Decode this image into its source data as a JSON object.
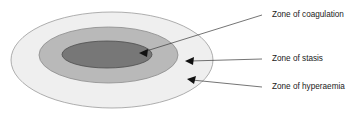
{
  "figure": {
    "background_color": "#ffffff"
  },
  "zones": [
    {
      "id": "coagulation",
      "label": "Zone of coagulation",
      "fill_color": "#777777",
      "stroke_color": "#4d4d4d",
      "ellipse": {
        "cx": 107,
        "cy": 54.5,
        "rx": 45,
        "ry": 13.5
      },
      "label_x": 272,
      "label_y": 15,
      "leader": {
        "x1": 262,
        "y1": 15,
        "x2": 143,
        "y2": 52
      },
      "arrow_tip": {
        "x": 139,
        "y": 53
      }
    },
    {
      "id": "stasis",
      "label": "Zone of stasis",
      "fill_color": "#b9b9b9",
      "stroke_color": "#8c8c8c",
      "ellipse": {
        "cx": 108.5,
        "cy": 55,
        "rx": 69.5,
        "ry": 28
      },
      "label_x": 272,
      "label_y": 59,
      "leader": {
        "x1": 262,
        "y1": 59,
        "x2": 190,
        "y2": 61
      },
      "arrow_tip": {
        "x": 185,
        "y": 61
      }
    },
    {
      "id": "hyperaemia",
      "label": "Zone of hyperaemia",
      "fill_color": "#efefef",
      "stroke_color": "#9a9a9a",
      "ellipse": {
        "cx": 112,
        "cy": 60,
        "rx": 101,
        "ry": 48
      },
      "label_x": 272,
      "label_y": 87,
      "leader": {
        "x1": 262,
        "y1": 87,
        "x2": 192,
        "y2": 80
      },
      "arrow_tip": {
        "x": 187,
        "y": 79
      }
    }
  ],
  "line_color": "#3a3a3a",
  "arrow_color": "#111111"
}
